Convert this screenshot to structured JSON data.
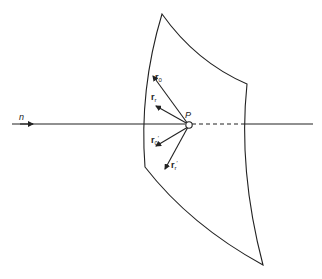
{
  "figure": {
    "type": "ray diagram at surface point",
    "labels": {
      "normal": "n",
      "point": "P",
      "r0": {
        "base": "r",
        "sub": "0"
      },
      "rr": {
        "base": "r",
        "sub": "r"
      },
      "r0p": {
        "base": "r",
        "sub": "0",
        "prime": "′"
      },
      "rrp": {
        "base": "r",
        "sub": "r",
        "prime": "′"
      }
    },
    "colors": {
      "ink": "#222222",
      "background": "#ffffff"
    }
  }
}
